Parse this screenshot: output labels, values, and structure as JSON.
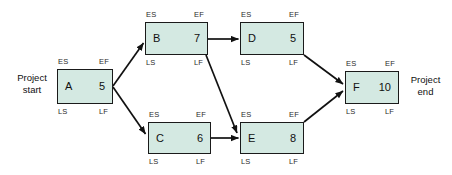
{
  "diagram": {
    "start_label_line1": "Project",
    "start_label_line2": "start",
    "end_label_line1": "Project",
    "end_label_line2": "end",
    "corner_labels": {
      "early_start": "ES",
      "early_finish": "EF",
      "late_start": "LS",
      "late_finish": "LF"
    },
    "colors": {
      "node_fill": "#d4e9e2",
      "node_border": "#1a1a1a",
      "arrow": "#111111",
      "text": "#101010",
      "background": "#ffffff"
    },
    "nodes": [
      {
        "id": "A",
        "duration": "5"
      },
      {
        "id": "B",
        "duration": "7"
      },
      {
        "id": "C",
        "duration": "6"
      },
      {
        "id": "D",
        "duration": "5"
      },
      {
        "id": "E",
        "duration": "8"
      },
      {
        "id": "F",
        "duration": "10"
      }
    ],
    "edges": [
      {
        "from": "A",
        "to": "B"
      },
      {
        "from": "A",
        "to": "C"
      },
      {
        "from": "B",
        "to": "D"
      },
      {
        "from": "B",
        "to": "E"
      },
      {
        "from": "C",
        "to": "E"
      },
      {
        "from": "D",
        "to": "F"
      },
      {
        "from": "E",
        "to": "F"
      }
    ]
  }
}
